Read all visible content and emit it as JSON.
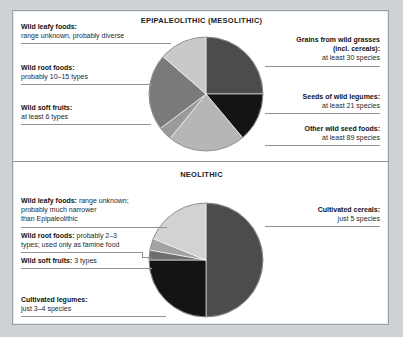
{
  "figure": {
    "background_color": "#cfd2d4",
    "panel_color": "#ffffff",
    "rule_color": "#8d9397"
  },
  "chart_data": [
    {
      "type": "pie",
      "title": "EPIPALEOLITHIC (MESOLITHIC)",
      "id": "epipaleolithic",
      "legend_position": "callout-labels",
      "categories": [
        "Grains from wild grasses (incl. cereals)",
        "Seeds of wild legumes",
        "Other wild seed foods",
        "Wild soft fruits",
        "Wild root foods",
        "Wild leafy foods"
      ],
      "values": [
        25,
        14,
        22,
        6,
        22,
        11
      ],
      "slice_colors": [
        "#4c4c4c",
        "#141414",
        "#b6b6b6",
        "#9a9a9a",
        "#7a7a7a",
        "#c9c9c9"
      ],
      "slice_start_angles": [
        0,
        90,
        140,
        219,
        233,
        311
      ],
      "slice_end_angles": [
        90,
        140,
        219,
        233,
        311,
        360
      ]
    },
    {
      "type": "pie",
      "title": "NEOLITHIC",
      "id": "neolithic",
      "legend_position": "callout-labels",
      "categories": [
        "Cultivated cereals",
        "Cultivated legumes",
        "Wild soft fruits",
        "Wild root foods",
        "Wild leafy foods"
      ],
      "values": [
        65,
        25,
        3,
        4,
        3
      ],
      "slice_colors": [
        "#4c4c4c",
        "#141414",
        "#6e6e6e",
        "#a3a3a3",
        "#d2d2d2"
      ],
      "slice_start_angles": [
        0,
        180,
        270,
        280,
        292
      ],
      "slice_end_angles": [
        180,
        270,
        280,
        292,
        360
      ]
    }
  ],
  "top_chart": {
    "title": "EPIPALEOLITHIC (MESOLITHIC)",
    "labels_left": [
      {
        "name": "wild-leafy-foods",
        "heading": "Wild leafy foods:",
        "detail": "range unknown, probably diverse"
      },
      {
        "name": "wild-root-foods",
        "heading": "Wild root foods:",
        "detail": "probably 10–15 types"
      },
      {
        "name": "wild-soft-fruits",
        "heading": "Wild soft fruits:",
        "detail": "at least 6 types"
      }
    ],
    "labels_right": [
      {
        "name": "grains-from-wild-grasses",
        "heading": "Grains from wild grasses",
        "heading2": "(incl. cereals):",
        "detail": "at least 30 species"
      },
      {
        "name": "seeds-of-wild-legumes",
        "heading": "Seeds of wild legumes:",
        "detail": "at least 21 species"
      },
      {
        "name": "other-wild-seed-foods",
        "heading": "Other wild seed foods:",
        "detail": "at least 89 species"
      }
    ]
  },
  "bottom_chart": {
    "title": "NEOLITHIC",
    "labels_left": [
      {
        "name": "wild-leafy-foods",
        "heading": "Wild leafy foods:",
        "detail": " range unknown;",
        "line2": "probably much narrower",
        "line3": "than Epipaleolithic"
      },
      {
        "name": "wild-root-foods",
        "heading": "Wild root foods:",
        "detail": " probably 2–3",
        "line2": "types; used only as famine food"
      },
      {
        "name": "wild-soft-fruits",
        "heading": "Wild soft fruits:",
        "detail": " 3 types"
      },
      {
        "name": "cultivated-legumes",
        "heading": "Cultivated legumes:",
        "detail": "just 3–4 species"
      }
    ],
    "labels_right": [
      {
        "name": "cultivated-cereals",
        "heading": "Cultivated cereals:",
        "detail": "just 5 species"
      }
    ]
  }
}
